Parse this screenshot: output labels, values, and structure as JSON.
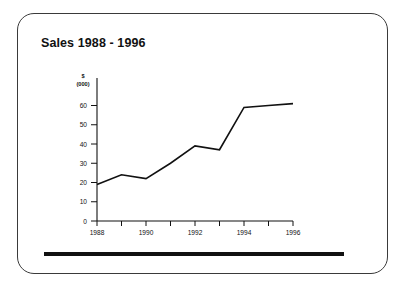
{
  "slide": {
    "title": "Sales 1988 - 1996",
    "unit_line1": "$",
    "unit_line2": "(000)",
    "frame_color": "#3a3a3a",
    "line_color": "#111111",
    "background": "#ffffff"
  },
  "chart_data": {
    "type": "line",
    "title": "Sales 1988 - 1996",
    "xlabel": "",
    "ylabel": "$ (000)",
    "x": [
      1988,
      1989,
      1990,
      1991,
      1992,
      1993,
      1994,
      1995,
      1996
    ],
    "values": [
      19,
      24,
      22,
      30,
      39,
      37,
      59,
      60,
      61
    ],
    "series": [
      {
        "name": "Sales",
        "values": [
          19,
          24,
          22,
          30,
          39,
          37,
          59,
          60,
          61
        ]
      }
    ],
    "xlim": [
      1988,
      1996
    ],
    "ylim": [
      0,
      65
    ],
    "ytick_labels": [
      "0",
      "10",
      "20",
      "30",
      "40",
      "50",
      "60"
    ],
    "ytick_values": [
      0,
      10,
      20,
      30,
      40,
      50,
      60
    ],
    "xtick_values": [
      1988,
      1989,
      1990,
      1991,
      1992,
      1993,
      1994,
      1995,
      1996
    ],
    "xtick_labels": [
      "1988",
      "",
      "1990",
      "",
      "1992",
      "",
      "1994",
      "",
      "1996"
    ],
    "xtick_labels_shown": [
      "1988",
      "1990",
      "1992",
      "1994",
      "1996"
    ],
    "grid": false,
    "legend": false,
    "legend_position": "none",
    "markers": false
  }
}
